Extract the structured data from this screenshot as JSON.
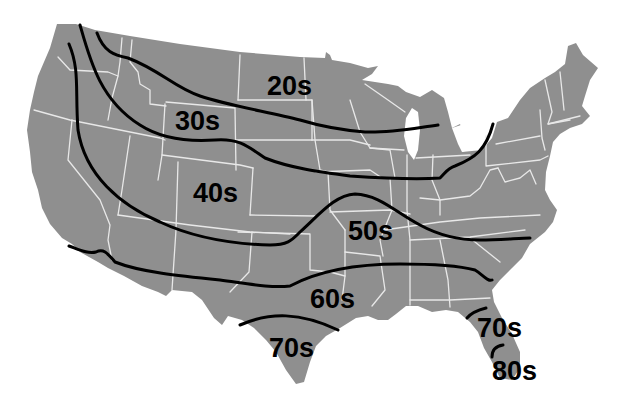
{
  "map": {
    "subject": "United States temperature zones",
    "land_color": "#8f8f8f",
    "border_color": "#e8e8e8",
    "isotherm_color": "#000000",
    "background_color": "#ffffff"
  },
  "zones": [
    {
      "id": "20s",
      "label": "20s",
      "x": 267,
      "y": 95
    },
    {
      "id": "30s",
      "label": "30s",
      "x": 175,
      "y": 130
    },
    {
      "id": "40s",
      "label": "40s",
      "x": 193,
      "y": 202
    },
    {
      "id": "50s",
      "label": "50s",
      "x": 348,
      "y": 240
    },
    {
      "id": "60s",
      "label": "60s",
      "x": 310,
      "y": 308
    },
    {
      "id": "70s-texas",
      "label": "70s",
      "x": 269,
      "y": 357
    },
    {
      "id": "70s-florida",
      "label": "70s",
      "x": 477,
      "y": 337
    },
    {
      "id": "80s-florida",
      "label": "80s",
      "x": 492,
      "y": 380
    }
  ]
}
